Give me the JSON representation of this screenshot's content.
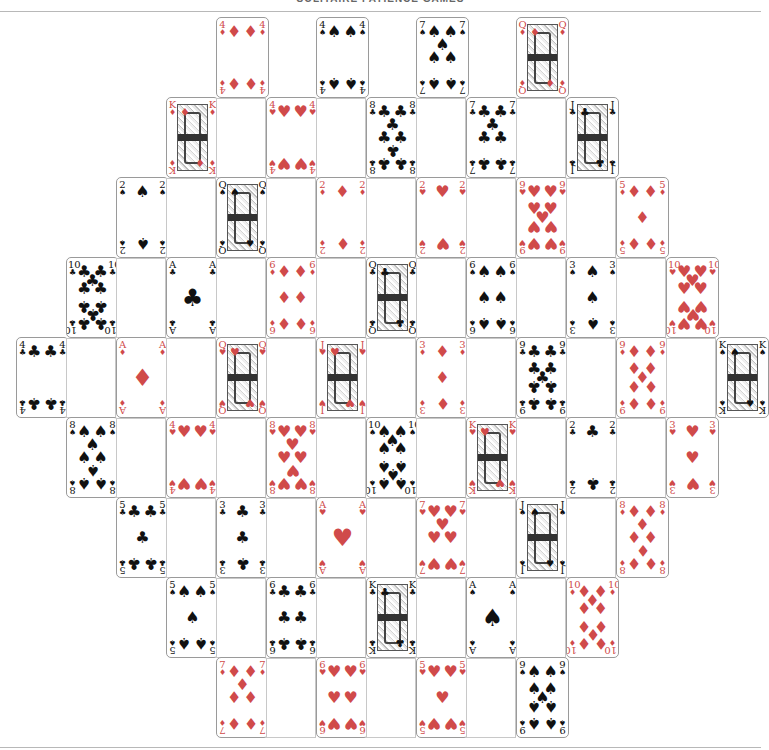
{
  "header": {
    "title": "SOLITAIRE PATIENCE GAMES"
  },
  "colors": {
    "red_suit": "#d04a4a",
    "black_suit": "#111111",
    "card_border": "#9a9a9a",
    "slot_border": "#c8c8c8"
  },
  "suits": {
    "S": "♠",
    "H": "♥",
    "D": "♦",
    "C": "♣"
  },
  "layout": {
    "card_width": 52,
    "card_height": 80,
    "column_pitch": 50,
    "row_pitch": 80,
    "rows": [
      {
        "y": 17,
        "start_x": 216,
        "cards": [
          "4D",
          "4S",
          "7S",
          "QD"
        ]
      },
      {
        "y": 97,
        "start_x": 166,
        "cards": [
          "KD",
          "4H",
          "8C",
          "7C",
          "JC"
        ]
      },
      {
        "y": 177,
        "start_x": 116,
        "cards": [
          "2S",
          "QS",
          "2D",
          "2H",
          "9H",
          "5D"
        ]
      },
      {
        "y": 257,
        "start_x": 66,
        "cards": [
          "10C",
          "AC",
          "6D",
          "QC",
          "6S",
          "3S",
          "10H"
        ]
      },
      {
        "y": 337,
        "start_x": 16,
        "cards": [
          "4C",
          "AD",
          "QH",
          "JH",
          "3D",
          "9C",
          "9D",
          "KS"
        ]
      },
      {
        "y": 417,
        "start_x": 66,
        "cards": [
          "8S",
          "4H",
          "8H",
          "10S",
          "KH",
          "2C",
          "3H"
        ]
      },
      {
        "y": 497,
        "start_x": 116,
        "cards": [
          "5C",
          "3C",
          "AH",
          "7H",
          "JS",
          "8D"
        ]
      },
      {
        "y": 577,
        "start_x": 166,
        "cards": [
          "5S",
          "6C",
          "KC",
          "AS",
          "10D"
        ]
      },
      {
        "y": 657,
        "start_x": 216,
        "cards": [
          "7D",
          "6H",
          "5H",
          "9S"
        ]
      }
    ]
  }
}
